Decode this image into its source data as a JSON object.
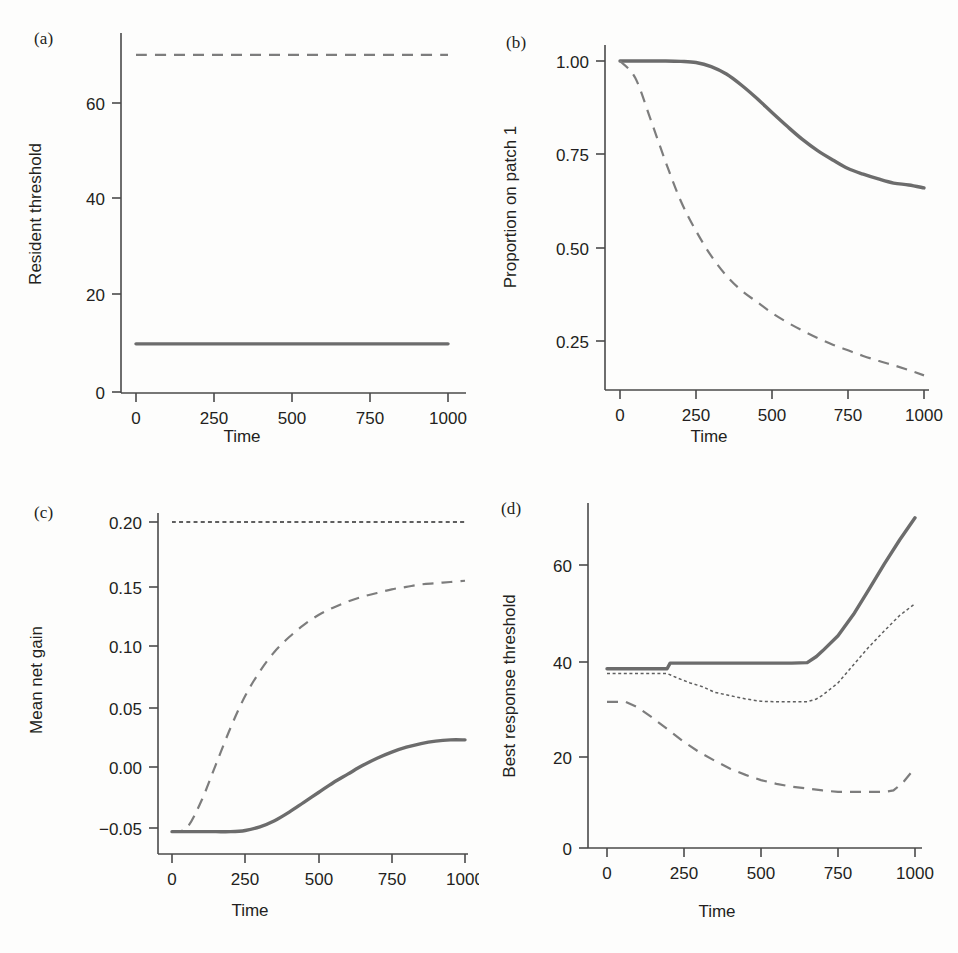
{
  "figure": {
    "panels": [
      {
        "id": "a",
        "label": "(a)",
        "ylabel": "Resident threshold",
        "xlabel": "Time"
      },
      {
        "id": "b",
        "label": "(b)",
        "ylabel": "Proportion on patch 1",
        "xlabel": "Time"
      },
      {
        "id": "c",
        "label": "(c)",
        "ylabel": "Mean net gain",
        "xlabel": "Time"
      },
      {
        "id": "d",
        "label": "(d)",
        "ylabel": "Best response threshold",
        "xlabel": "Time"
      }
    ]
  },
  "colors": {
    "solid_line": "#6c6c6c",
    "dashed_line": "#7d7d7d",
    "dotted_line": "#5f5f5f",
    "axis": "#4a4a4a",
    "text": "#231f20",
    "background": "#fdfdfc"
  },
  "chart_data": [
    {
      "type": "line",
      "panel": "a",
      "title": "(a)",
      "xlabel": "Time",
      "ylabel": "Resident threshold",
      "xlim": [
        0,
        1000
      ],
      "ylim": [
        0,
        75
      ],
      "xticks": [
        0,
        250,
        500,
        750,
        1000
      ],
      "xticklabels": [
        "0",
        "250",
        "500",
        "750",
        "1000"
      ],
      "yticks": [
        0,
        20,
        40,
        60
      ],
      "yticklabels": [
        "0",
        "20",
        "40",
        "60"
      ],
      "grid": false,
      "legend": "none",
      "series": [
        {
          "name": "dashed-constant-high",
          "style": "dashed",
          "x": [
            0,
            100,
            200,
            300,
            400,
            500,
            600,
            700,
            800,
            900,
            1000
          ],
          "values": [
            70,
            70,
            70,
            70,
            70,
            70,
            70,
            70,
            70,
            70,
            70
          ]
        },
        {
          "name": "solid-constant-low",
          "style": "solid",
          "x": [
            0,
            100,
            200,
            300,
            400,
            500,
            600,
            700,
            800,
            900,
            1000
          ],
          "values": [
            10,
            10,
            10,
            10,
            10,
            10,
            10,
            10,
            10,
            10,
            10
          ]
        }
      ]
    },
    {
      "type": "line",
      "panel": "b",
      "title": "(b)",
      "xlabel": "Time",
      "ylabel": "Proportion on patch 1",
      "xlim": [
        0,
        1000
      ],
      "ylim": [
        0.14,
        1.02
      ],
      "xticks": [
        0,
        250,
        500,
        750,
        1000
      ],
      "xticklabels": [
        "0",
        "250",
        "500",
        "750",
        "1000"
      ],
      "yticks": [
        0.25,
        0.5,
        0.75,
        1.0
      ],
      "yticklabels": [
        "0.25",
        "0.50",
        "0.75",
        "1.00"
      ],
      "grid": false,
      "legend": "none",
      "series": [
        {
          "name": "solid-slow-decline",
          "style": "solid",
          "x": [
            0,
            50,
            100,
            150,
            200,
            250,
            300,
            350,
            400,
            450,
            500,
            550,
            600,
            650,
            700,
            750,
            800,
            850,
            900,
            950,
            1000
          ],
          "values": [
            1.0,
            1.0,
            1.0,
            1.0,
            0.999,
            0.996,
            0.985,
            0.965,
            0.935,
            0.9,
            0.862,
            0.825,
            0.79,
            0.76,
            0.735,
            0.712,
            0.697,
            0.684,
            0.673,
            0.668,
            0.66
          ]
        },
        {
          "name": "dashed-fast-decline",
          "style": "dashed",
          "x": [
            0,
            50,
            100,
            150,
            200,
            250,
            300,
            350,
            400,
            450,
            500,
            550,
            600,
            650,
            700,
            750,
            800,
            850,
            900,
            950,
            1000
          ],
          "values": [
            1.0,
            0.955,
            0.845,
            0.73,
            0.625,
            0.545,
            0.478,
            0.425,
            0.385,
            0.355,
            0.325,
            0.3,
            0.278,
            0.258,
            0.24,
            0.225,
            0.21,
            0.197,
            0.185,
            0.172,
            0.158
          ]
        }
      ]
    },
    {
      "type": "line",
      "panel": "c",
      "title": "(c)",
      "xlabel": "Time",
      "ylabel": "Mean net gain",
      "xlim": [
        0,
        1000
      ],
      "ylim": [
        -0.062,
        0.205
      ],
      "xticks": [
        0,
        250,
        500,
        750,
        1000
      ],
      "xticklabels": [
        "0",
        "250",
        "500",
        "750",
        "1000"
      ],
      "yticks": [
        -0.05,
        0.0,
        0.05,
        0.1,
        0.15,
        0.2
      ],
      "yticklabels": [
        "−0.05",
        "0.00",
        "0.05",
        "0.10",
        "0.15",
        "0.20"
      ],
      "grid": false,
      "legend": "none",
      "series": [
        {
          "name": "dotted-constant-max",
          "style": "dotted",
          "x": [
            0,
            250,
            500,
            750,
            1000
          ],
          "values": [
            0.2,
            0.2,
            0.2,
            0.2,
            0.2
          ]
        },
        {
          "name": "dashed-fast-rise",
          "style": "dashed",
          "x": [
            0,
            50,
            100,
            150,
            200,
            250,
            300,
            350,
            400,
            450,
            500,
            550,
            600,
            650,
            700,
            750,
            800,
            850,
            900,
            950,
            1000
          ],
          "values": [
            -0.053,
            -0.05,
            -0.028,
            0.002,
            0.032,
            0.058,
            0.078,
            0.094,
            0.106,
            0.116,
            0.124,
            0.13,
            0.135,
            0.139,
            0.142,
            0.145,
            0.147,
            0.149,
            0.15,
            0.151,
            0.152
          ]
        },
        {
          "name": "solid-slow-rise",
          "style": "solid",
          "x": [
            0,
            50,
            100,
            150,
            200,
            250,
            300,
            350,
            400,
            450,
            500,
            550,
            600,
            650,
            700,
            750,
            800,
            850,
            900,
            950,
            1000
          ],
          "values": [
            -0.053,
            -0.053,
            -0.053,
            -0.053,
            -0.053,
            -0.052,
            -0.049,
            -0.044,
            -0.037,
            -0.029,
            -0.021,
            -0.013,
            -0.006,
            0.001,
            0.007,
            0.012,
            0.016,
            0.019,
            0.021,
            0.022,
            0.022
          ]
        }
      ]
    },
    {
      "type": "line",
      "panel": "d",
      "title": "(d)",
      "xlabel": "Time",
      "ylabel": "Best response threshold",
      "xlim": [
        0,
        1000
      ],
      "ylim": [
        0,
        72
      ],
      "xticks": [
        0,
        250,
        500,
        750,
        1000
      ],
      "xticklabels": [
        "0",
        "250",
        "500",
        "750",
        "1000"
      ],
      "yticks": [
        0,
        20,
        40,
        60
      ],
      "yticklabels": [
        "0",
        "20",
        "40",
        "60"
      ],
      "grid": false,
      "legend": "none",
      "series": [
        {
          "name": "solid-step-rise",
          "style": "solid",
          "x": [
            0,
            100,
            195,
            205,
            300,
            400,
            500,
            600,
            650,
            680,
            700,
            750,
            800,
            850,
            900,
            950,
            1000
          ],
          "values": [
            38.0,
            38.0,
            38.0,
            39.2,
            39.2,
            39.2,
            39.2,
            39.2,
            39.3,
            40.6,
            41.8,
            45.0,
            49.5,
            54.8,
            60.2,
            65.3,
            70.0
          ]
        },
        {
          "name": "dotted-dip-rise",
          "style": "dotted",
          "x": [
            0,
            100,
            195,
            230,
            270,
            310,
            350,
            400,
            450,
            500,
            550,
            600,
            650,
            680,
            700,
            750,
            800,
            850,
            900,
            950,
            1000
          ],
          "values": [
            37.0,
            37.0,
            37.0,
            36.0,
            35.0,
            34.2,
            33.0,
            32.3,
            31.6,
            31.1,
            31.0,
            31.0,
            31.0,
            31.6,
            32.4,
            35.0,
            38.8,
            42.6,
            46.0,
            49.3,
            51.8
          ]
        },
        {
          "name": "dashed-deep-dip",
          "style": "dashed",
          "x": [
            0,
            60,
            100,
            150,
            200,
            250,
            300,
            350,
            400,
            450,
            500,
            550,
            600,
            650,
            700,
            750,
            800,
            850,
            900,
            930,
            960,
            1000
          ],
          "values": [
            31.0,
            31.0,
            29.8,
            27.5,
            25.0,
            22.5,
            20.3,
            18.5,
            16.8,
            15.5,
            14.4,
            13.6,
            13.0,
            12.6,
            12.2,
            11.9,
            11.9,
            11.9,
            11.9,
            12.2,
            13.8,
            17.0
          ]
        }
      ]
    }
  ]
}
